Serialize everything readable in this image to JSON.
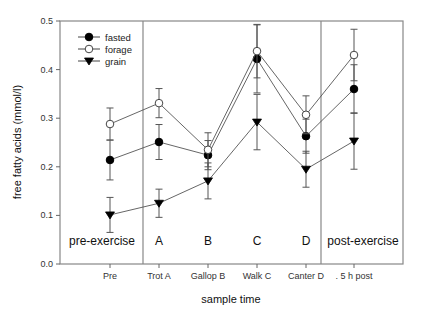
{
  "chart_data": {
    "type": "line",
    "title": "",
    "xlabel": "sample time",
    "ylabel": "free fatty acids (mmol/l)",
    "ylim": [
      0.0,
      0.5
    ],
    "yticks": [
      "0.0",
      "0.1",
      "0.2",
      "0.3",
      "0.4",
      "0.5"
    ],
    "categories": [
      "Pre",
      "Trot A",
      "Gallop B",
      "Walk C",
      "Canter D",
      ". 5 h post"
    ],
    "grid": false,
    "legend_position": "upper-left",
    "series": [
      {
        "name": "fasted",
        "marker": "filled-circle",
        "values": [
          0.214,
          0.251,
          0.224,
          0.422,
          0.263,
          0.36
        ],
        "error": [
          0.041,
          0.036,
          0.03,
          0.07,
          0.035,
          0.05
        ]
      },
      {
        "name": "forage",
        "marker": "open-circle",
        "values": [
          0.288,
          0.331,
          0.235,
          0.438,
          0.307,
          0.43
        ],
        "error": [
          0.033,
          0.03,
          0.035,
          0.055,
          0.039,
          0.053
        ]
      },
      {
        "name": "grain",
        "marker": "filled-triangle-down",
        "values": [
          0.101,
          0.125,
          0.171,
          0.292,
          0.195,
          0.253
        ],
        "error": [
          0.036,
          0.029,
          0.037,
          0.057,
          0.037,
          0.058
        ]
      }
    ],
    "regions": [
      {
        "label": "pre-exercise"
      },
      {
        "label": "A"
      },
      {
        "label": "B"
      },
      {
        "label": "C"
      },
      {
        "label": "D"
      },
      {
        "label": "post-exercise"
      }
    ]
  }
}
